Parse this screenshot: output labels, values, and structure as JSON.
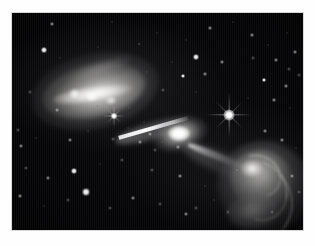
{
  "page": {
    "background_color": "#ffffff",
    "width": 315,
    "height": 246
  },
  "plate": {
    "name": "astronomical-image-plate",
    "background_color": "#010102",
    "border_color": "#d8d8d8",
    "left": 12,
    "top": 13,
    "width": 291,
    "height": 217
  },
  "chart_data": {
    "type": "scatter",
    "title": "",
    "subtitle": "",
    "xlabel": "",
    "ylabel": "",
    "grid": false,
    "legend_position": "none",
    "palette": {
      "sky": "#010102",
      "emission_bright": "#ffffff",
      "emission_mid": "#b4b3b1",
      "emission_faint": "#4a4a4c",
      "star": "#ffffff",
      "frame": "#ffffff"
    },
    "components": [
      {
        "name": "host-galaxy-nucleus",
        "kind": "point-source",
        "x": 167,
        "y": 121,
        "brightness": 1.0
      },
      {
        "name": "jet-northeast",
        "kind": "linear-jet",
        "x1": 168,
        "y1": 120,
        "x2": 105,
        "y2": 100,
        "brightness": 0.95
      },
      {
        "name": "lobe-northeast",
        "kind": "diffuse-lobe",
        "x": 83,
        "y": 78,
        "width": 130,
        "height": 76,
        "angle_deg": -13,
        "brightness": 0.62
      },
      {
        "name": "hotspot-northeast-ridge",
        "kind": "ridge",
        "x": 81,
        "y": 81,
        "brightness": 0.95
      },
      {
        "name": "counter-jet-southwest",
        "kind": "linear-jet",
        "x1": 176,
        "y1": 128,
        "x2": 234,
        "y2": 151,
        "brightness": 0.55
      },
      {
        "name": "lobe-southwest",
        "kind": "diffuse-lobe",
        "x": 252,
        "y": 174,
        "width": 95,
        "height": 92,
        "angle_deg": 18,
        "brightness": 0.5
      },
      {
        "name": "hotspot-southwest",
        "kind": "compact-hotspot",
        "x": 240,
        "y": 155,
        "brightness": 0.92
      },
      {
        "name": "filament-arcs-southwest",
        "kind": "arc-filaments",
        "count": 3,
        "brightness": 0.35
      }
    ],
    "spike_stars": [
      {
        "name": "bright-star-with-diffraction-spikes",
        "x": 229,
        "y": 115,
        "size": 11,
        "spike_length": 46
      },
      {
        "name": "small-star-with-diffraction-spikes",
        "x": 114,
        "y": 116,
        "size": 6,
        "spike_length": 22
      }
    ],
    "field_stars": [
      {
        "x": 52,
        "y": 24,
        "r": 1.3,
        "class": "dim"
      },
      {
        "x": 112,
        "y": 22,
        "r": 1.1,
        "class": "faint"
      },
      {
        "x": 157,
        "y": 33,
        "r": 1.0,
        "class": "faint"
      },
      {
        "x": 44,
        "y": 50,
        "r": 2.0,
        "class": "bright"
      },
      {
        "x": 98,
        "y": 47,
        "r": 1.1,
        "class": "faint"
      },
      {
        "x": 139,
        "y": 44,
        "r": 1.1,
        "class": "dim"
      },
      {
        "x": 186,
        "y": 40,
        "r": 1.0,
        "class": "faint"
      },
      {
        "x": 210,
        "y": 28,
        "r": 1.2,
        "class": "dim"
      },
      {
        "x": 233,
        "y": 22,
        "r": 1.1,
        "class": "faint"
      },
      {
        "x": 252,
        "y": 35,
        "r": 1.2,
        "class": "dim"
      },
      {
        "x": 268,
        "y": 45,
        "r": 1.0,
        "class": "faint"
      },
      {
        "x": 287,
        "y": 33,
        "r": 1.1,
        "class": "faint"
      },
      {
        "x": 196,
        "y": 57,
        "r": 2.1,
        "class": "bright"
      },
      {
        "x": 222,
        "y": 62,
        "r": 1.4,
        "class": "dim"
      },
      {
        "x": 253,
        "y": 58,
        "r": 1.2,
        "class": "faint"
      },
      {
        "x": 276,
        "y": 60,
        "r": 1.6,
        "class": "dim"
      },
      {
        "x": 295,
        "y": 52,
        "r": 1.7,
        "class": "dim"
      },
      {
        "x": 289,
        "y": 69,
        "r": 1.2,
        "class": "faint"
      },
      {
        "x": 183,
        "y": 76,
        "r": 1.7,
        "class": "bright"
      },
      {
        "x": 205,
        "y": 74,
        "r": 1.4,
        "class": "dim"
      },
      {
        "x": 264,
        "y": 80,
        "r": 1.8,
        "class": "bright"
      },
      {
        "x": 286,
        "y": 86,
        "r": 1.3,
        "class": "dim"
      },
      {
        "x": 299,
        "y": 75,
        "r": 1.2,
        "class": "faint"
      },
      {
        "x": 147,
        "y": 72,
        "r": 1.0,
        "class": "faint"
      },
      {
        "x": 163,
        "y": 90,
        "r": 1.2,
        "class": "faint"
      },
      {
        "x": 196,
        "y": 92,
        "r": 1.1,
        "class": "faint"
      },
      {
        "x": 248,
        "y": 98,
        "r": 1.1,
        "class": "faint"
      },
      {
        "x": 274,
        "y": 100,
        "r": 1.3,
        "class": "dim"
      },
      {
        "x": 290,
        "y": 108,
        "r": 1.1,
        "class": "faint"
      },
      {
        "x": 30,
        "y": 92,
        "r": 1.2,
        "class": "faint"
      },
      {
        "x": 57,
        "y": 110,
        "r": 1.3,
        "class": "dim"
      },
      {
        "x": 97,
        "y": 106,
        "r": 1.1,
        "class": "faint"
      },
      {
        "x": 129,
        "y": 108,
        "r": 1.0,
        "class": "faint"
      },
      {
        "x": 18,
        "y": 130,
        "r": 1.2,
        "class": "faint"
      },
      {
        "x": 21,
        "y": 146,
        "r": 1.5,
        "class": "dim"
      },
      {
        "x": 36,
        "y": 138,
        "r": 1.0,
        "class": "faint"
      },
      {
        "x": 70,
        "y": 140,
        "r": 1.5,
        "class": "dim"
      },
      {
        "x": 88,
        "y": 131,
        "r": 1.0,
        "class": "faint"
      },
      {
        "x": 113,
        "y": 139,
        "r": 1.2,
        "class": "faint"
      },
      {
        "x": 140,
        "y": 142,
        "r": 1.6,
        "class": "dim"
      },
      {
        "x": 155,
        "y": 150,
        "r": 1.2,
        "class": "faint"
      },
      {
        "x": 178,
        "y": 147,
        "r": 1.4,
        "class": "dim"
      },
      {
        "x": 199,
        "y": 152,
        "r": 1.1,
        "class": "faint"
      },
      {
        "x": 265,
        "y": 131,
        "r": 1.4,
        "class": "dim"
      },
      {
        "x": 282,
        "y": 140,
        "r": 1.3,
        "class": "dim"
      },
      {
        "x": 296,
        "y": 148,
        "r": 1.1,
        "class": "faint"
      },
      {
        "x": 26,
        "y": 168,
        "r": 1.2,
        "class": "faint"
      },
      {
        "x": 48,
        "y": 178,
        "r": 1.5,
        "class": "dim"
      },
      {
        "x": 74,
        "y": 171,
        "r": 2.6,
        "class": "bright"
      },
      {
        "x": 100,
        "y": 164,
        "r": 1.1,
        "class": "faint"
      },
      {
        "x": 122,
        "y": 160,
        "r": 1.2,
        "class": "faint"
      },
      {
        "x": 152,
        "y": 170,
        "r": 1.3,
        "class": "faint"
      },
      {
        "x": 180,
        "y": 176,
        "r": 1.4,
        "class": "dim"
      },
      {
        "x": 205,
        "y": 186,
        "r": 1.1,
        "class": "faint"
      },
      {
        "x": 292,
        "y": 176,
        "r": 1.5,
        "class": "dim"
      },
      {
        "x": 299,
        "y": 192,
        "r": 1.2,
        "class": "faint"
      },
      {
        "x": 20,
        "y": 196,
        "r": 1.3,
        "class": "dim"
      },
      {
        "x": 44,
        "y": 206,
        "r": 1.1,
        "class": "faint"
      },
      {
        "x": 68,
        "y": 200,
        "r": 1.2,
        "class": "faint"
      },
      {
        "x": 86,
        "y": 192,
        "r": 2.7,
        "class": "bright"
      },
      {
        "x": 110,
        "y": 208,
        "r": 1.2,
        "class": "faint"
      },
      {
        "x": 133,
        "y": 198,
        "r": 1.4,
        "class": "dim"
      },
      {
        "x": 160,
        "y": 204,
        "r": 1.3,
        "class": "faint"
      },
      {
        "x": 186,
        "y": 214,
        "r": 1.8,
        "class": "dim"
      },
      {
        "x": 196,
        "y": 208,
        "r": 1.2,
        "class": "faint"
      },
      {
        "x": 214,
        "y": 200,
        "r": 1.1,
        "class": "faint"
      },
      {
        "x": 228,
        "y": 212,
        "r": 1.2,
        "class": "faint"
      },
      {
        "x": 250,
        "y": 206,
        "r": 1.1,
        "class": "faint"
      },
      {
        "x": 272,
        "y": 212,
        "r": 1.3,
        "class": "faint"
      },
      {
        "x": 60,
        "y": 58,
        "r": 1.0,
        "class": "faint"
      },
      {
        "x": 119,
        "y": 66,
        "r": 1.0,
        "class": "faint"
      },
      {
        "x": 172,
        "y": 62,
        "r": 1.0,
        "class": "faint"
      },
      {
        "x": 237,
        "y": 170,
        "r": 1.2,
        "class": "faint"
      },
      {
        "x": 256,
        "y": 190,
        "r": 1.1,
        "class": "faint"
      },
      {
        "x": 144,
        "y": 122,
        "r": 1.0,
        "class": "faint"
      },
      {
        "x": 128,
        "y": 128,
        "r": 1.1,
        "class": "faint"
      },
      {
        "x": 150,
        "y": 134,
        "r": 1.3,
        "class": "dim"
      },
      {
        "x": 162,
        "y": 142,
        "r": 1.0,
        "class": "faint"
      }
    ]
  }
}
